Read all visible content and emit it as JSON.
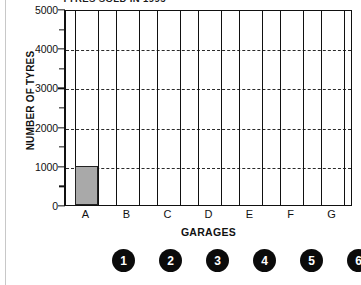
{
  "chart_data": {
    "type": "bar",
    "title": "TYRES SOLD IN 1995",
    "xlabel": "GARAGES",
    "ylabel": "NUMBER OF TYRES",
    "categories": [
      "A",
      "B",
      "C",
      "D",
      "E",
      "F",
      "G"
    ],
    "values": [
      1000,
      0,
      0,
      0,
      0,
      0,
      0
    ],
    "ylim": [
      0,
      5000
    ],
    "ytick_labels": [
      "0",
      "1000",
      "2000",
      "3000",
      "4000",
      "5000"
    ],
    "ytick_values": [
      0,
      1000,
      2000,
      3000,
      4000,
      5000
    ],
    "yminor_values": [
      500,
      1500,
      2500,
      3500,
      4500
    ],
    "gridlines": [
      1000,
      2000,
      3000,
      4000
    ],
    "grid": "horizontal-dashed",
    "legend": "none",
    "bar_color": "#a9a9a9",
    "bar_edge_color": "#222222",
    "axis_color": "#111111"
  },
  "answer_choices": [
    {
      "label": "1"
    },
    {
      "label": "2"
    },
    {
      "label": "3"
    },
    {
      "label": "4"
    },
    {
      "label": "5"
    },
    {
      "label": "6"
    }
  ]
}
